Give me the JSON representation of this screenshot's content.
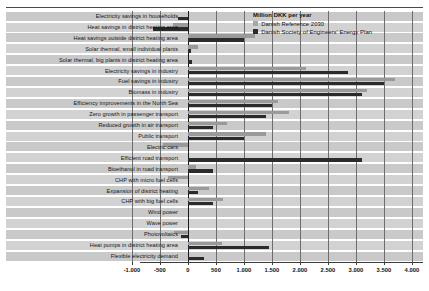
{
  "chart_data": {
    "type": "bar",
    "orientation": "horizontal",
    "title": "",
    "xlabel": "",
    "ylabel": "",
    "unit_note": "Million DKK per year",
    "xlim": [
      -1250,
      4150
    ],
    "xticks": [
      -1000,
      -500,
      0,
      500,
      1000,
      1500,
      2000,
      2500,
      3000,
      3500,
      4000
    ],
    "xticklabels": [
      "-1.000",
      "-500",
      "0",
      "500",
      "1.000",
      "1.500",
      "2.000",
      "2.500",
      "3.000",
      "3.500",
      "4.000"
    ],
    "grid": true,
    "grid_axis": "x",
    "legend_position": "top-right",
    "categories": [
      "Electricity savings in households",
      "Heat savings in district heating area",
      "Heat savings outside district heating area",
      "Solar thermal, small individual plants",
      "Solar thermal, big plants in district heating area",
      "Electricity savings in industry",
      "Fuel savings in industry",
      "Biomass in industry",
      "Efficiency improvements in the North Sea",
      "Zero growth in passenger transport",
      "Reduced growth in air transport",
      "Public transport",
      "Electric cars",
      "Efficient road transport",
      "Bioethanol in road transport",
      "CHP with micro fuel cells",
      "Expansion of district heating",
      "CHP with big fuel cells",
      "Wind power",
      "Wave power",
      "Photovoltaics",
      "Heat pumps in district heating area",
      "Flexible electricity demand"
    ],
    "series": [
      {
        "name": "Danish Reference 2030",
        "color": "#9a9a9a",
        "values": [
          0,
          -270,
          1200,
          170,
          0,
          2100,
          3700,
          3200,
          1600,
          1800,
          700,
          1400,
          -450,
          0,
          150,
          -350,
          380,
          620,
          0,
          0,
          -250,
          600,
          0
        ]
      },
      {
        "name": "Danish Society of Engineers' Energy Plan",
        "color": "#2b2b2b",
        "values": [
          -180,
          -630,
          1000,
          60,
          70,
          2850,
          3500,
          3100,
          1500,
          1400,
          450,
          1000,
          0,
          3100,
          450,
          0,
          180,
          450,
          0,
          0,
          -130,
          1450,
          280
        ]
      }
    ]
  },
  "legend": {
    "title": "Million DKK per year",
    "items": [
      {
        "label": "Danish Reference 2030",
        "swatch": "ref"
      },
      {
        "label": "Danish Society of Engineers' Energy Plan",
        "swatch": "ida"
      }
    ]
  }
}
